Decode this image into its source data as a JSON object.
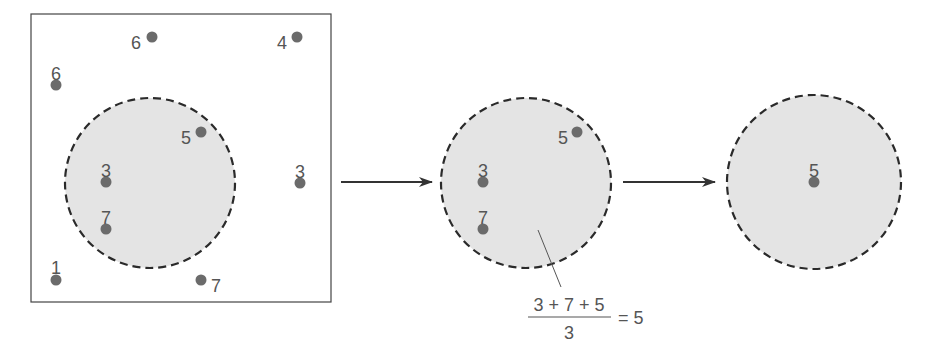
{
  "diagram": {
    "colors": {
      "point": "#6b6b6b",
      "circle_fill": "#e4e4e4",
      "circle_stroke": "#2a2a2a",
      "label": "#555555",
      "arrow": "#333333"
    },
    "panel1": {
      "points": [
        {
          "label": "6",
          "x": 152,
          "y": 37,
          "lx": 136,
          "ly": 43
        },
        {
          "label": "4",
          "x": 297,
          "y": 37,
          "lx": 282,
          "ly": 43
        },
        {
          "label": "6",
          "x": 56,
          "y": 85,
          "lx": 56,
          "ly": 74
        },
        {
          "label": "5",
          "x": 201,
          "y": 132,
          "lx": 186,
          "ly": 138
        },
        {
          "label": "3",
          "x": 106,
          "y": 182,
          "lx": 106,
          "ly": 171
        },
        {
          "label": "3",
          "x": 300,
          "y": 183,
          "lx": 300,
          "ly": 172
        },
        {
          "label": "7",
          "x": 106,
          "y": 229,
          "lx": 106,
          "ly": 218
        },
        {
          "label": "1",
          "x": 56,
          "y": 280,
          "lx": 56,
          "ly": 268
        },
        {
          "label": "7",
          "x": 201,
          "y": 280,
          "lx": 216,
          "ly": 286
        }
      ]
    },
    "panel2": {
      "points": [
        {
          "label": "5",
          "x": 577,
          "y": 132,
          "lx": 563,
          "ly": 138
        },
        {
          "label": "3",
          "x": 483,
          "y": 182,
          "lx": 483,
          "ly": 171
        },
        {
          "label": "7",
          "x": 483,
          "y": 229,
          "lx": 483,
          "ly": 218
        }
      ],
      "formula": {
        "numerator": "3 + 7 + 5",
        "denominator": "3",
        "result": "= 5"
      }
    },
    "panel3": {
      "points": [
        {
          "label": "5",
          "x": 814,
          "y": 182,
          "lx": 814,
          "ly": 171
        }
      ]
    }
  }
}
